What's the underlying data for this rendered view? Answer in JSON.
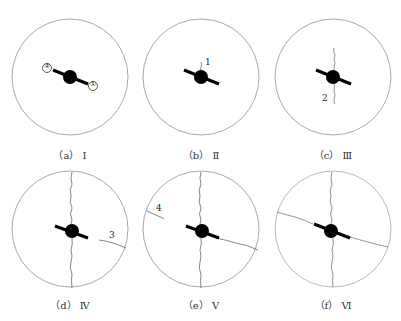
{
  "figure": {
    "panels": [
      {
        "id": "a",
        "caption": "（a） Ⅰ",
        "cx": 70,
        "cy": 77,
        "markers": [
          "②",
          "①"
        ],
        "crack_labels": []
      },
      {
        "id": "b",
        "caption": "（b） Ⅱ",
        "cx": 201,
        "cy": 77,
        "crack_labels": [
          "1"
        ]
      },
      {
        "id": "c",
        "caption": "（c） Ⅲ",
        "cx": 333,
        "cy": 77,
        "crack_labels": [
          "2"
        ]
      },
      {
        "id": "d",
        "caption": "（d） Ⅳ",
        "cx": 70,
        "cy": 229,
        "crack_labels": [
          "3"
        ]
      },
      {
        "id": "e",
        "caption": "（e） Ⅴ",
        "cx": 201,
        "cy": 229,
        "crack_labels": [
          "4"
        ]
      },
      {
        "id": "f",
        "caption": "（f） Ⅵ",
        "cx": 333,
        "cy": 229,
        "crack_labels": []
      }
    ],
    "colors": {
      "circle": "#a8a8a8",
      "anchor": "#000000",
      "crack": "#777777",
      "text": "#333333"
    }
  }
}
